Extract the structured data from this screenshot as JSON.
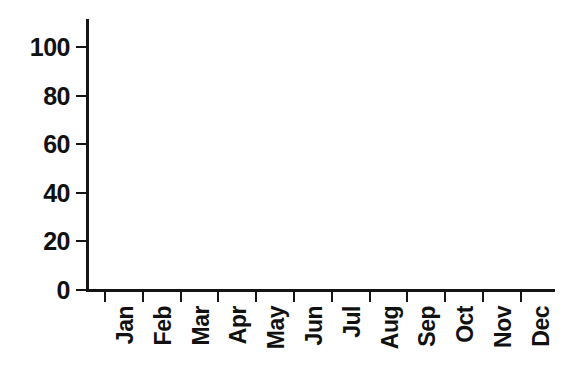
{
  "chart_data": {
    "type": "bar",
    "title": "",
    "subtitle": "",
    "xlabel": "",
    "ylabel": "",
    "categories": [
      "Jan",
      "Feb",
      "Mar",
      "Apr",
      "May",
      "Jun",
      "Jul",
      "Aug",
      "Sep",
      "Oct",
      "Nov",
      "Dec"
    ],
    "values": [
      0,
      0,
      0,
      0,
      0,
      0,
      0,
      0,
      0,
      0,
      0,
      0
    ],
    "ylim": [
      0,
      111
    ],
    "y_ticks": [
      0,
      20,
      40,
      60,
      80,
      100
    ],
    "y_tick_labels": [
      "0",
      "20",
      "40",
      "60",
      "80",
      "100"
    ],
    "x_tick_labels": [
      "Jan",
      "Feb",
      "Mar",
      "Apr",
      "May",
      "Jun",
      "Jul",
      "Aug",
      "Sep",
      "Oct",
      "Nov",
      "Dec"
    ],
    "grid": false,
    "legend": false,
    "legend_position": "none",
    "annotations": [],
    "x_label_rotation": -90,
    "series": [
      {
        "name": "",
        "values": [
          0,
          0,
          0,
          0,
          0,
          0,
          0,
          0,
          0,
          0,
          0,
          0
        ]
      }
    ]
  },
  "style": {
    "background_color": "#ffffff",
    "axis_color": "#141414",
    "text_color": "#111111"
  }
}
